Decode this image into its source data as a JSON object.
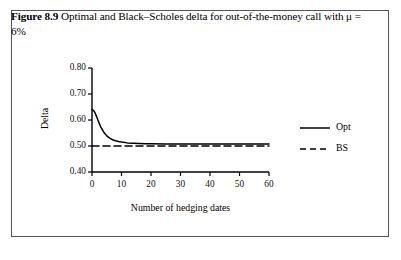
{
  "figure": {
    "label": "Figure 8.9",
    "caption": "Optimal and Black–Scholes delta for out-of-the-money call with μ = 6%"
  },
  "chart_data": {
    "type": "line",
    "title": "",
    "xlabel": "Number of hedging dates",
    "ylabel": "Delta",
    "xlim": [
      0,
      60
    ],
    "ylim": [
      0.4,
      0.8
    ],
    "xticks": [
      0,
      10,
      20,
      30,
      40,
      50,
      60
    ],
    "xtick_labels": [
      "0",
      "10",
      "20",
      "30",
      "40",
      "50",
      "60"
    ],
    "yticks": [
      0.4,
      0.5,
      0.6,
      0.7,
      0.8
    ],
    "ytick_labels": [
      "0.40",
      "0.50",
      "0.60",
      "0.70",
      "0.80"
    ],
    "grid": false,
    "legend_position": "right",
    "series": [
      {
        "name": "Opt",
        "style": "solid",
        "color": "#000000",
        "x": [
          0,
          0.5,
          1,
          1.5,
          2,
          2.5,
          3,
          4,
          5,
          6,
          7,
          8,
          9,
          10,
          12,
          14,
          16,
          18,
          20,
          25,
          30,
          35,
          40,
          45,
          50,
          55,
          60
        ],
        "y": [
          0.64,
          0.637,
          0.628,
          0.615,
          0.6,
          0.586,
          0.573,
          0.553,
          0.539,
          0.53,
          0.524,
          0.52,
          0.517,
          0.515,
          0.512,
          0.511,
          0.51,
          0.509,
          0.509,
          0.508,
          0.508,
          0.508,
          0.508,
          0.508,
          0.508,
          0.508,
          0.508
        ]
      },
      {
        "name": "BS",
        "style": "dashed",
        "color": "#000000",
        "x": [
          0,
          60
        ],
        "y": [
          0.5,
          0.5
        ]
      }
    ],
    "legend": [
      {
        "label": "Opt",
        "style": "solid"
      },
      {
        "label": "BS",
        "style": "dashed"
      }
    ]
  }
}
